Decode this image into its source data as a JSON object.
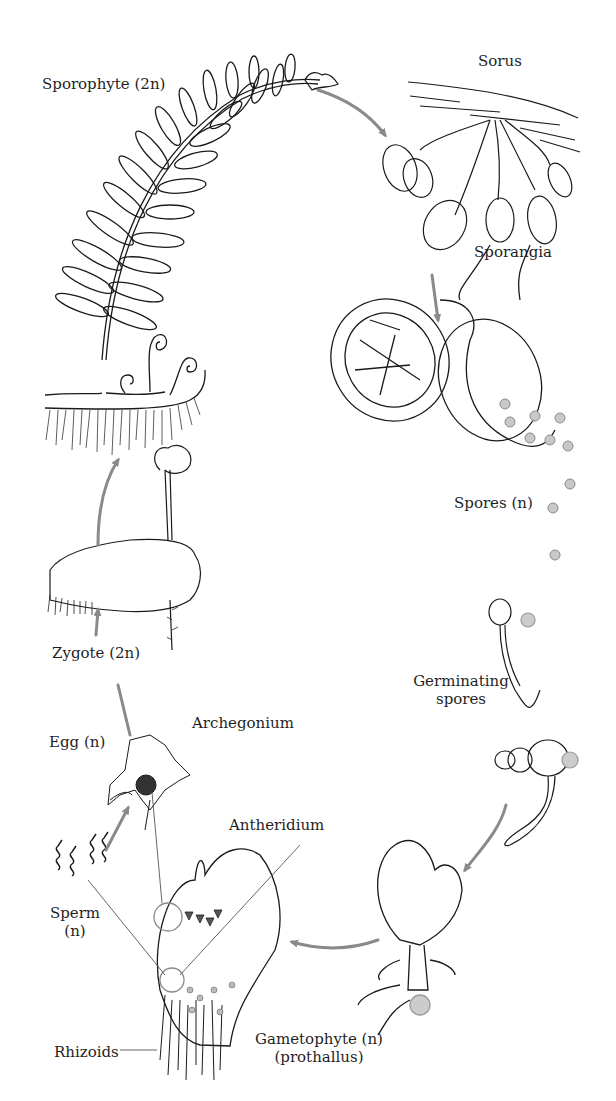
{
  "diagram": {
    "arrow_color": "#8a8a8a",
    "line_color": "#1a1a1a",
    "stages": [
      {
        "id": "sporophyte",
        "label": "Sporophyte (2n)"
      },
      {
        "id": "sorus",
        "label": "Sorus"
      },
      {
        "id": "sporangia",
        "label": "Sporangia"
      },
      {
        "id": "spores",
        "label": "Spores (n)"
      },
      {
        "id": "germinating",
        "label_line1": "Germinating",
        "label_line2": "spores"
      },
      {
        "id": "gametophyte",
        "label_line1": "Gametophyte (n)",
        "label_line2": "(prothallus)"
      },
      {
        "id": "antheridium",
        "label": "Antheridium"
      },
      {
        "id": "archegonium",
        "label": "Archegonium"
      },
      {
        "id": "egg",
        "label": "Egg (n)"
      },
      {
        "id": "sperm",
        "label_line1": "Sperm",
        "label_line2": "(n)"
      },
      {
        "id": "rhizoids",
        "label": "Rhizoids"
      },
      {
        "id": "zygote",
        "label": "Zygote (2n)"
      }
    ]
  }
}
